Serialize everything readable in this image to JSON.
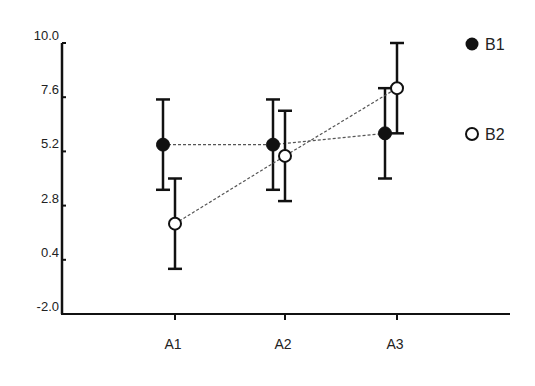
{
  "chart_data": {
    "type": "line",
    "title": "",
    "xlabel": "",
    "ylabel": "",
    "categories": [
      "A1",
      "A2",
      "A3"
    ],
    "yticks": [
      "10.0",
      "7.6",
      "5.2",
      "2.8",
      "0.4",
      "-2.0"
    ],
    "ylim": [
      -2.0,
      10.0
    ],
    "grid": false,
    "legend_position": "right",
    "series": [
      {
        "name": "B1",
        "marker": "filled-circle",
        "line_style": "dashed",
        "values": [
          5.5,
          5.5,
          6.0
        ],
        "error": [
          2.0,
          2.0,
          2.0
        ]
      },
      {
        "name": "B2",
        "marker": "open-circle",
        "line_style": "dashed",
        "values": [
          2.0,
          5.0,
          8.0
        ],
        "error": [
          2.0,
          2.0,
          2.0
        ]
      }
    ]
  },
  "colors": {
    "axis": "#111111",
    "marker": "#111111",
    "connector": "#555555",
    "text": "#222222"
  }
}
